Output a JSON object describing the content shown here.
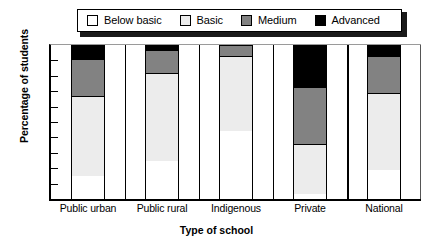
{
  "chart_data": {
    "type": "bar",
    "subtype": "stacked-bar-100",
    "title": "",
    "xlabel": "Type of school",
    "ylabel": "Percentage of students",
    "categories": [
      "Public urban",
      "Public rural",
      "Indigenous",
      "Private",
      "National"
    ],
    "ylim": [
      0,
      100
    ],
    "yticks": [
      0,
      10,
      20,
      30,
      40,
      50,
      60,
      70,
      80,
      90,
      100
    ],
    "ytick_labels": [
      "0",
      "10",
      "20",
      "30",
      "40",
      "50",
      "60",
      "70",
      "80",
      "90",
      "100"
    ],
    "grid": false,
    "legend_position": "top",
    "series": [
      {
        "name": "Below basic",
        "color": "#ffffff",
        "values": [
          15,
          25,
          44,
          3,
          19
        ]
      },
      {
        "name": "Basic",
        "color": "#ececec",
        "values": [
          52,
          57,
          49,
          33,
          50
        ]
      },
      {
        "name": "Medium",
        "color": "#828282",
        "values": [
          24,
          15,
          7,
          37,
          24
        ]
      },
      {
        "name": "Advanced",
        "color": "#000000",
        "values": [
          9,
          3,
          0,
          27,
          7
        ]
      }
    ],
    "cumulative_tops": {
      "Public urban": [
        15,
        67,
        91,
        100
      ],
      "Public rural": [
        25,
        82,
        97,
        100
      ],
      "Indigenous": [
        44,
        93,
        100,
        100
      ],
      "Private": [
        3,
        36,
        73,
        100
      ],
      "National": [
        19,
        69,
        93,
        100
      ]
    }
  },
  "legend": {
    "items": [
      {
        "label": "Below basic",
        "color": "#ffffff"
      },
      {
        "label": "Basic",
        "color": "#ececec"
      },
      {
        "label": "Medium",
        "color": "#828282"
      },
      {
        "label": "Advanced",
        "color": "#000000"
      }
    ]
  }
}
